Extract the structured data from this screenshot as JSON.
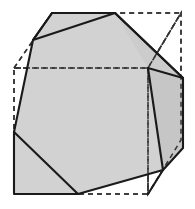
{
  "figure": {
    "canvas": {
      "width": 195,
      "height": 209,
      "background": "#ffffff"
    },
    "colors": {
      "solid_fill": "#d2d2d2",
      "solid_fill_dark": "#bdbdbd",
      "outline": "#1a1a1a",
      "dashed_line": "#333333",
      "background": "#ffffff"
    },
    "strokes": {
      "outline_width": 2.1,
      "dashed_width": 1.5,
      "dash_pattern": "5,4"
    },
    "wireframe_cube": {
      "label": "dashed-bounding-cube",
      "front_face": [
        [
          14,
          68
        ],
        [
          148,
          68
        ],
        [
          148,
          194
        ],
        [
          14,
          194
        ]
      ],
      "top_face": [
        [
          14,
          68
        ],
        [
          52,
          13
        ],
        [
          181,
          13
        ],
        [
          148,
          68
        ]
      ],
      "right_face": [
        [
          148,
          68
        ],
        [
          181,
          13
        ],
        [
          181,
          140
        ],
        [
          148,
          194
        ]
      ],
      "vertices": {
        "front_top_left": [
          14,
          68
        ],
        "front_top_right": [
          148,
          68
        ],
        "front_bottom_right": [
          148,
          194
        ],
        "front_bottom_left": [
          14,
          194
        ],
        "back_top_left": [
          52,
          13
        ],
        "back_top_right": [
          181,
          13
        ],
        "back_bottom_right": [
          181,
          140
        ]
      }
    },
    "solid": {
      "label": "truncated-cube-outline",
      "outline": [
        [
          52,
          13
        ],
        [
          115,
          13
        ],
        [
          183,
          78
        ],
        [
          183,
          148
        ],
        [
          163,
          170
        ],
        [
          78,
          194
        ],
        [
          14,
          194
        ],
        [
          14,
          132
        ],
        [
          33,
          40
        ]
      ],
      "interior_edges": [
        {
          "name": "edge-top-left-cut",
          "from": [
            33,
            40
          ],
          "to": [
            52,
            13
          ]
        },
        {
          "name": "edge-top-ridge",
          "from": [
            33,
            40
          ],
          "to": [
            115,
            13
          ]
        },
        {
          "name": "edge-right-upper",
          "from": [
            115,
            13
          ],
          "to": [
            183,
            78
          ]
        },
        {
          "name": "edge-right-ridge",
          "from": [
            148,
            68
          ],
          "to": [
            183,
            78
          ]
        },
        {
          "name": "edge-right-lower",
          "from": [
            148,
            68
          ],
          "to": [
            163,
            170
          ]
        },
        {
          "name": "edge-bottom-right-cut",
          "from": [
            163,
            170
          ],
          "to": [
            148,
            194
          ]
        },
        {
          "name": "edge-bottom-left-cut",
          "from": [
            14,
            132
          ],
          "to": [
            78,
            194
          ]
        }
      ],
      "faces": [
        {
          "name": "face-front-hexagon",
          "shade": "#d2d2d2",
          "points": [
            [
              33,
              40
            ],
            [
              115,
              13
            ],
            [
              148,
              68
            ],
            [
              163,
              170
            ],
            [
              78,
              194
            ],
            [
              14,
              132
            ]
          ]
        },
        {
          "name": "face-top-cut-triangle",
          "shade": "#d2d2d2",
          "points": [
            [
              33,
              40
            ],
            [
              52,
              13
            ],
            [
              115,
              13
            ]
          ]
        },
        {
          "name": "face-right-upper",
          "shade": "#cccccc",
          "points": [
            [
              115,
              13
            ],
            [
              183,
              78
            ],
            [
              148,
              68
            ]
          ]
        },
        {
          "name": "face-right-side",
          "shade": "#c6c6c6",
          "points": [
            [
              148,
              68
            ],
            [
              183,
              78
            ],
            [
              183,
              148
            ],
            [
              163,
              170
            ]
          ]
        },
        {
          "name": "face-bottom-right-corner",
          "shade": "#cfcfcf",
          "points": [
            [
              163,
              170
            ],
            [
              183,
              148
            ],
            [
              163,
              170
            ]
          ]
        },
        {
          "name": "face-bottom-left-corner",
          "shade": "#d2d2d2",
          "points": [
            [
              14,
              132
            ],
            [
              78,
              194
            ],
            [
              14,
              194
            ]
          ]
        }
      ]
    }
  }
}
